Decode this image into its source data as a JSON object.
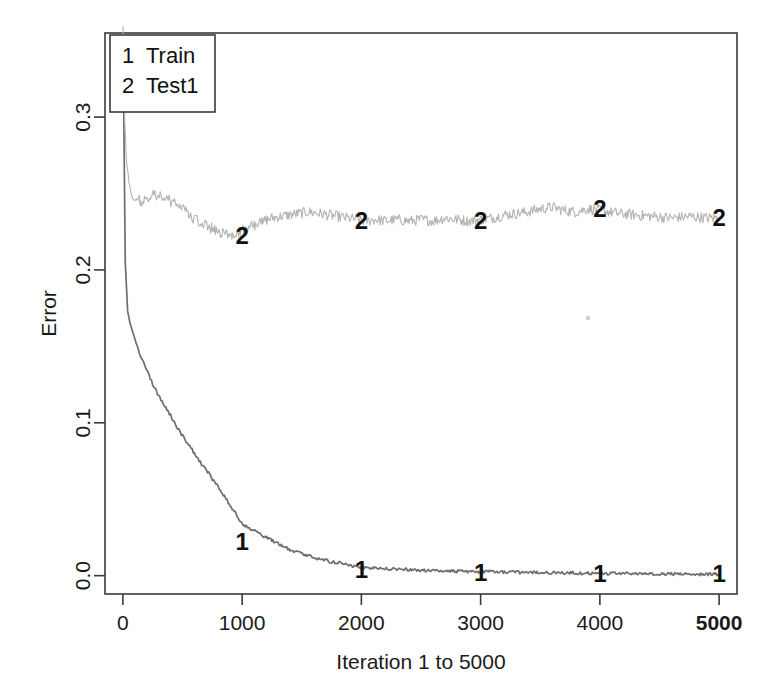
{
  "chart_data": {
    "type": "line",
    "title": "",
    "xlabel": "Iteration 1 to 5000",
    "ylabel": "Error",
    "xlim": [
      -150,
      5150
    ],
    "ylim": [
      -0.012,
      0.355
    ],
    "xticks": [
      0,
      1000,
      2000,
      3000,
      4000,
      5000
    ],
    "xticklabels": [
      "0",
      "1000",
      "2000",
      "3000",
      "4000",
      "5000"
    ],
    "xticklabels_bold": [
      "5000"
    ],
    "yticks": [
      0.0,
      0.1,
      0.2,
      0.3
    ],
    "yticklabels": [
      "0.0",
      "0.1",
      "0.2",
      "0.3"
    ],
    "grid": false,
    "legend_position": "top-left",
    "legend": [
      {
        "key": "1",
        "label": "Train"
      },
      {
        "key": "2",
        "label": "Test1"
      }
    ],
    "series": [
      {
        "name": "Train",
        "key": "1",
        "color": "#6e6e6e",
        "marker_label": "1",
        "marker_x": [
          1000,
          2000,
          3000,
          4000,
          5000
        ],
        "marker_y": [
          0.022,
          0.004,
          0.002,
          0.001,
          0.001
        ],
        "x": [
          1,
          20,
          40,
          60,
          80,
          100,
          120,
          150,
          180,
          210,
          240,
          270,
          300,
          330,
          360,
          400,
          440,
          480,
          520,
          560,
          600,
          640,
          680,
          720,
          760,
          800,
          850,
          900,
          950,
          1000,
          1060,
          1120,
          1180,
          1250,
          1320,
          1400,
          1480,
          1560,
          1650,
          1750,
          1850,
          1950,
          2050,
          2200,
          2350,
          2500,
          2700,
          2900,
          3100,
          3300,
          3500,
          3700,
          3900,
          4100,
          4300,
          4500,
          4700,
          4900,
          5000
        ],
        "y": [
          0.352,
          0.205,
          0.173,
          0.165,
          0.16,
          0.155,
          0.15,
          0.143,
          0.139,
          0.133,
          0.127,
          0.122,
          0.118,
          0.114,
          0.11,
          0.105,
          0.099,
          0.094,
          0.089,
          0.085,
          0.08,
          0.075,
          0.071,
          0.067,
          0.062,
          0.058,
          0.052,
          0.046,
          0.04,
          0.034,
          0.031,
          0.029,
          0.026,
          0.023,
          0.02,
          0.017,
          0.015,
          0.013,
          0.011,
          0.009,
          0.008,
          0.006,
          0.005,
          0.0045,
          0.004,
          0.0035,
          0.003,
          0.0028,
          0.0025,
          0.0022,
          0.002,
          0.0018,
          0.0016,
          0.0014,
          0.0013,
          0.0012,
          0.0011,
          0.001,
          0.001
        ]
      },
      {
        "name": "Test1",
        "key": "2",
        "color": "#b4b4b4",
        "marker_label": "2",
        "marker_x": [
          1000,
          2000,
          3000,
          4000,
          5000
        ],
        "marker_y": [
          0.222,
          0.232,
          0.232,
          0.24,
          0.234
        ],
        "x": [
          1,
          15,
          30,
          50,
          70,
          90,
          110,
          130,
          150,
          175,
          200,
          230,
          260,
          290,
          320,
          350,
          380,
          410,
          440,
          470,
          500,
          530,
          560,
          590,
          620,
          650,
          690,
          730,
          770,
          810,
          850,
          900,
          950,
          1000,
          1060,
          1120,
          1180,
          1250,
          1320,
          1400,
          1480,
          1560,
          1640,
          1720,
          1800,
          1880,
          1960,
          2040,
          2120,
          2200,
          2300,
          2400,
          2500,
          2600,
          2700,
          2800,
          2900,
          3000,
          3100,
          3200,
          3300,
          3400,
          3500,
          3600,
          3700,
          3800,
          3900,
          4000,
          4150,
          4300,
          4450,
          4600,
          4750,
          4900,
          5000
        ],
        "y": [
          0.36,
          0.3,
          0.272,
          0.258,
          0.25,
          0.246,
          0.245,
          0.247,
          0.243,
          0.246,
          0.248,
          0.247,
          0.25,
          0.246,
          0.249,
          0.245,
          0.247,
          0.243,
          0.245,
          0.241,
          0.243,
          0.238,
          0.236,
          0.234,
          0.232,
          0.23,
          0.229,
          0.228,
          0.226,
          0.225,
          0.224,
          0.223,
          0.224,
          0.226,
          0.228,
          0.23,
          0.232,
          0.234,
          0.235,
          0.236,
          0.237,
          0.238,
          0.237,
          0.236,
          0.235,
          0.234,
          0.233,
          0.232,
          0.233,
          0.232,
          0.233,
          0.232,
          0.233,
          0.232,
          0.234,
          0.233,
          0.232,
          0.233,
          0.234,
          0.236,
          0.237,
          0.238,
          0.24,
          0.241,
          0.239,
          0.238,
          0.24,
          0.239,
          0.237,
          0.236,
          0.235,
          0.234,
          0.235,
          0.234,
          0.234
        ]
      }
    ]
  }
}
